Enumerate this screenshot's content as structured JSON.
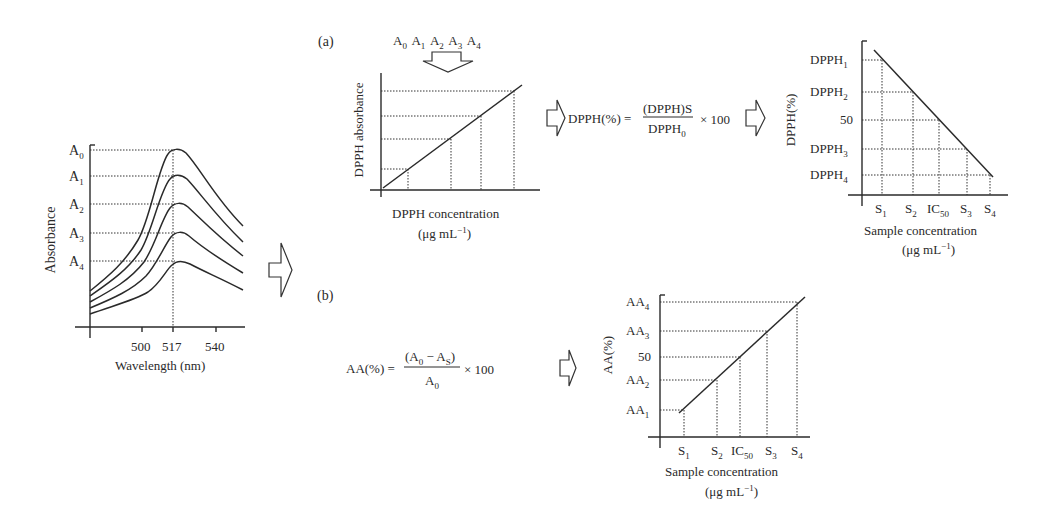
{
  "panel_left": {
    "ylabel": "Absorbance",
    "xlabel": "Wavelength (nm)",
    "y_ticks": [
      {
        "base": "A",
        "sub": "0"
      },
      {
        "base": "A",
        "sub": "1"
      },
      {
        "base": "A",
        "sub": "2"
      },
      {
        "base": "A",
        "sub": "3"
      },
      {
        "base": "A",
        "sub": "4"
      }
    ],
    "x_ticks": [
      "500",
      "517",
      "540"
    ]
  },
  "transition_arrow": "right-arrow",
  "panel_a": {
    "label": "(a)",
    "input_labels": [
      {
        "base": "A",
        "sub": "0"
      },
      {
        "base": "A",
        "sub": "1"
      },
      {
        "base": "A",
        "sub": "2"
      },
      {
        "base": "A",
        "sub": "3"
      },
      {
        "base": "A",
        "sub": "4"
      }
    ],
    "calibration_chart": {
      "ylabel": "DPPH absorbance",
      "xlabel": "DPPH concentration",
      "xunit": "(μg mL",
      "xunit_sup": "−1",
      "xunit_close": ")"
    },
    "formula": {
      "lhs": "DPPH(%) =",
      "numerator": "(DPPH)S",
      "denominator_base": "DPPH",
      "denominator_sub": "0",
      "multiplier": "× 100"
    },
    "result_chart": {
      "ylabel": "DPPH(%)",
      "y_ticks": [
        {
          "base": "DPPH",
          "sub": "1"
        },
        {
          "base": "DPPH",
          "sub": "2"
        },
        {
          "base": "50",
          "sub": ""
        },
        {
          "base": "DPPH",
          "sub": "3"
        },
        {
          "base": "DPPH",
          "sub": "4"
        }
      ],
      "x_ticks": [
        {
          "base": "S",
          "sub": "1"
        },
        {
          "base": "S",
          "sub": "2"
        },
        {
          "base": "IC",
          "sub": "50"
        },
        {
          "base": "S",
          "sub": "3"
        },
        {
          "base": "S",
          "sub": "4"
        }
      ],
      "xlabel": "Sample concentration",
      "xunit": "(μg mL",
      "xunit_sup": "−1",
      "xunit_close": ")"
    }
  },
  "panel_b": {
    "label": "(b)",
    "formula": {
      "lhs": "AA(%) =",
      "numerator_open": "(A",
      "numerator_sub1": "0",
      "numerator_mid": " − A",
      "numerator_sub2": "S",
      "numerator_close": ")",
      "denominator_base": "A",
      "denominator_sub": "0",
      "multiplier": "× 100"
    },
    "result_chart": {
      "ylabel": "AA(%)",
      "y_ticks": [
        {
          "base": "AA",
          "sub": "4"
        },
        {
          "base": "AA",
          "sub": "3"
        },
        {
          "base": "50",
          "sub": ""
        },
        {
          "base": "AA",
          "sub": "2"
        },
        {
          "base": "AA",
          "sub": "1"
        }
      ],
      "x_ticks": [
        {
          "base": "S",
          "sub": "1"
        },
        {
          "base": "S",
          "sub": "2"
        },
        {
          "base": "IC",
          "sub": "50"
        },
        {
          "base": "S",
          "sub": "3"
        },
        {
          "base": "S",
          "sub": "4"
        }
      ],
      "xlabel": "Sample concentration",
      "xunit": "(μg mL",
      "xunit_sup": "−1",
      "xunit_close": ")"
    }
  }
}
